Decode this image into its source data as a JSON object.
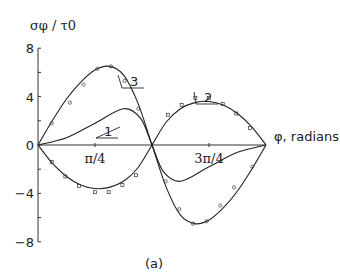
{
  "chart_data": {
    "type": "line",
    "title": "",
    "ylabel": "σφ / τ0",
    "xlabel": "φ, radians",
    "caption": "(a)",
    "ylim": [
      -8,
      8
    ],
    "xlim_pi": [
      0,
      1
    ],
    "y_ticks": [
      {
        "v": 8,
        "label": "8"
      },
      {
        "v": 4,
        "label": "4"
      },
      {
        "v": 0,
        "label": "0"
      },
      {
        "v": -4,
        "label": "−4"
      },
      {
        "v": -8,
        "label": "−8"
      }
    ],
    "x_ticks": [
      {
        "v": 0.25,
        "label": "π/4"
      },
      {
        "v": 0.75,
        "label": "3π/4"
      }
    ],
    "series": [
      {
        "name": "1",
        "x_pi": [
          0,
          0.125,
          0.25,
          0.375,
          0.45,
          0.5,
          0.55,
          0.625,
          0.75,
          0.875,
          1
        ],
        "values": [
          0,
          0.6,
          1.8,
          3.0,
          2.2,
          0,
          -2.2,
          -3.0,
          -1.8,
          -0.6,
          0
        ]
      },
      {
        "name": "2",
        "x_pi": [
          0,
          0.0625,
          0.125,
          0.1875,
          0.25,
          0.3125,
          0.375,
          0.4375,
          0.5,
          0.5625,
          0.625,
          0.6875,
          0.75,
          0.8125,
          0.875,
          0.9375,
          1
        ],
        "values": [
          0,
          -1.5,
          -2.6,
          -3.3,
          -3.6,
          -3.5,
          -3.0,
          -1.9,
          0,
          1.9,
          3.0,
          3.5,
          3.6,
          3.3,
          2.6,
          1.5,
          0
        ]
      },
      {
        "name": "3",
        "x_pi": [
          0,
          0.0625,
          0.125,
          0.1875,
          0.25,
          0.3125,
          0.375,
          0.4375,
          0.5,
          0.5625,
          0.625,
          0.6875,
          0.75,
          0.8125,
          0.875,
          0.9375,
          1
        ],
        "values": [
          0,
          2.0,
          3.8,
          5.2,
          6.2,
          6.5,
          5.8,
          3.5,
          0,
          -3.5,
          -5.8,
          -6.5,
          -6.2,
          -5.2,
          -3.8,
          -2.0,
          0
        ]
      }
    ],
    "markers": {
      "series2_x_pi": [
        0.06,
        0.12,
        0.18,
        0.25,
        0.31,
        0.37,
        0.43,
        0.57,
        0.63,
        0.69,
        0.75,
        0.81,
        0.87,
        0.93
      ],
      "series2_values": [
        -1.4,
        -2.6,
        -3.4,
        -3.9,
        -3.9,
        -3.3,
        -2.5,
        2.5,
        3.3,
        3.9,
        3.9,
        3.4,
        2.6,
        1.4
      ],
      "series3_x_pi": [
        0.06,
        0.14,
        0.2,
        0.26,
        0.32,
        0.38,
        0.44,
        0.56,
        0.62,
        0.68,
        0.74,
        0.8,
        0.86,
        0.94
      ],
      "series3_values": [
        1.8,
        3.5,
        5.0,
        6.3,
        6.5,
        5.3,
        3.0,
        -3.0,
        -5.3,
        -6.5,
        -6.3,
        -5.0,
        -3.5,
        -1.8
      ]
    }
  }
}
